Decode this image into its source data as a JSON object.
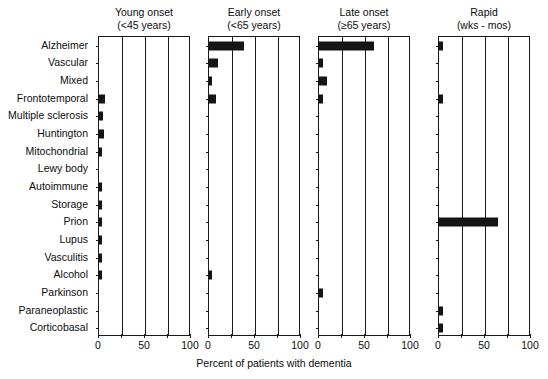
{
  "chart_data": {
    "type": "bar",
    "orientation": "horizontal",
    "title": "",
    "xlabel": "Percent of patients with dementia",
    "ylabel": "",
    "xlim": [
      0,
      100
    ],
    "xticks": [
      0,
      50,
      100
    ],
    "xtick_labels": [
      "0",
      "50",
      "100"
    ],
    "grid": true,
    "legend": "none",
    "categories": [
      "Alzheimer",
      "Vascular",
      "Mixed",
      "Frontotemporal",
      "Multiple sclerosis",
      "Huntington",
      "Mitochondrial",
      "Lewy body",
      "Autoimmune",
      "Storage",
      "Prion",
      "Lupus",
      "Vasculitis",
      "Alcohol",
      "Parkinson",
      "Paraneoplastic",
      "Corticobasal"
    ],
    "panels": [
      {
        "key": "young",
        "title_line1": "Young onset",
        "title_line2": "(<45 years)",
        "values": [
          0,
          0,
          0,
          7,
          4,
          5,
          2.5,
          0,
          3,
          3,
          3,
          3.5,
          3.5,
          3.5,
          0,
          0,
          0
        ]
      },
      {
        "key": "early",
        "title_line1": "Early onset",
        "title_line2": "(<65 years)",
        "values": [
          38,
          10,
          2,
          8,
          0,
          0,
          0,
          0,
          0,
          0,
          0,
          0,
          0,
          3,
          0,
          0,
          0
        ]
      },
      {
        "key": "late",
        "title_line1": "Late onset",
        "title_line2": "(≥65 years)",
        "values": [
          60,
          4,
          9,
          4,
          0,
          0,
          0,
          0,
          0,
          0,
          0,
          0,
          0,
          0,
          4,
          0,
          0
        ]
      },
      {
        "key": "rapid",
        "title_line1": "Rapid",
        "title_line2": "(wks - mos)",
        "values": [
          4,
          0,
          0,
          4,
          0,
          0,
          0,
          0,
          0,
          0,
          64,
          0,
          0,
          0,
          0,
          4,
          4
        ]
      }
    ]
  },
  "colors": {
    "bar": "#151515",
    "axis": "#1a1a1a",
    "text": "#0d0d0d",
    "background": "#ffffff"
  }
}
